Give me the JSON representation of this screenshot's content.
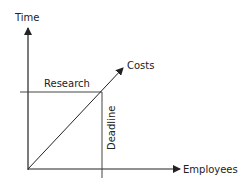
{
  "diagram": {
    "axes": {
      "y_label": "Time",
      "x_label": "Employees"
    },
    "lines": {
      "diagonal_label": "Costs",
      "horizontal_label": "Research",
      "vertical_label": "Deadline"
    },
    "colors": {
      "axis": "#222222",
      "guide": "#444444",
      "background": "#ffffff"
    }
  }
}
